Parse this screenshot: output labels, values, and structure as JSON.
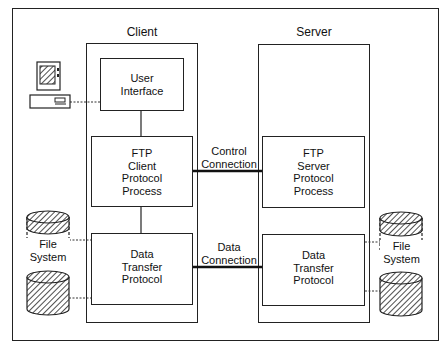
{
  "client": {
    "title": "Client",
    "user_interface": [
      "User",
      "Interface"
    ],
    "protocol_process": [
      "FTP",
      "Client",
      "Protocol",
      "Process"
    ],
    "data_transfer": [
      "Data",
      "Transfer",
      "Protocol"
    ],
    "file_system": [
      "File",
      "System"
    ]
  },
  "server": {
    "title": "Server",
    "protocol_process": [
      "FTP",
      "Server",
      "Protocol",
      "Process"
    ],
    "data_transfer": [
      "Data",
      "Transfer",
      "Protocol"
    ],
    "file_system": [
      "File",
      "System"
    ]
  },
  "connections": {
    "control": [
      "Control",
      "Connection"
    ],
    "data": [
      "Data",
      "Connection"
    ]
  },
  "icons": {
    "terminal": "computer-terminal-icon",
    "disk": "disk-cylinder-icon"
  }
}
